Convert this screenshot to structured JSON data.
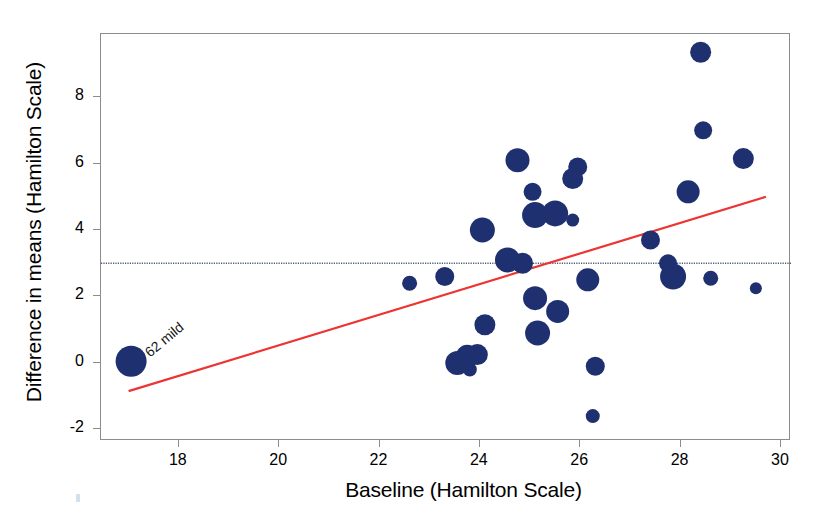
{
  "chart_data": {
    "type": "scatter",
    "title": "",
    "xlabel": "Baseline (Hamilton Scale)",
    "ylabel": "Difference in means (Hamilton Scale)",
    "xlim": [
      16.45,
      30.2
    ],
    "ylim": [
      -2.35,
      9.9
    ],
    "xticks": [
      18,
      20,
      22,
      24,
      26,
      28,
      30
    ],
    "xticklabels": [
      "18",
      "20",
      "22",
      "24",
      "26",
      "28",
      "30"
    ],
    "yticks": [
      8,
      6,
      4,
      2,
      0,
      -2
    ],
    "yticklabels": [
      "8",
      "6",
      "4",
      "2",
      "0",
      "-2"
    ],
    "grid": false,
    "legend": null,
    "marker_color": "#1f3070",
    "bubble_note": "marker area proportional to study weight",
    "points": [
      {
        "x": 17.05,
        "y": 0.05,
        "size": 15.5,
        "label": "62 mild"
      },
      {
        "x": 22.6,
        "y": 2.4,
        "size": 7.5
      },
      {
        "x": 23.3,
        "y": 2.6,
        "size": 9.5
      },
      {
        "x": 23.55,
        "y": 0.0,
        "size": 12.0
      },
      {
        "x": 23.75,
        "y": 0.2,
        "size": 11.5
      },
      {
        "x": 23.8,
        "y": -0.2,
        "size": 7.0
      },
      {
        "x": 23.95,
        "y": 0.25,
        "size": 10.5
      },
      {
        "x": 24.05,
        "y": 4.0,
        "size": 12.5
      },
      {
        "x": 24.1,
        "y": 1.15,
        "size": 10.5
      },
      {
        "x": 24.55,
        "y": 3.1,
        "size": 12.5
      },
      {
        "x": 24.75,
        "y": 6.1,
        "size": 12.0
      },
      {
        "x": 24.85,
        "y": 3.0,
        "size": 10.5
      },
      {
        "x": 25.05,
        "y": 5.15,
        "size": 9.0
      },
      {
        "x": 25.1,
        "y": 4.45,
        "size": 13.0
      },
      {
        "x": 25.1,
        "y": 1.95,
        "size": 12.0
      },
      {
        "x": 25.15,
        "y": 0.9,
        "size": 12.5
      },
      {
        "x": 25.5,
        "y": 4.5,
        "size": 13.0
      },
      {
        "x": 25.55,
        "y": 1.55,
        "size": 11.5
      },
      {
        "x": 25.95,
        "y": 5.9,
        "size": 9.5
      },
      {
        "x": 25.85,
        "y": 5.55,
        "size": 10.5
      },
      {
        "x": 25.85,
        "y": 4.3,
        "size": 6.5
      },
      {
        "x": 26.15,
        "y": 2.5,
        "size": 11.5
      },
      {
        "x": 26.3,
        "y": -0.1,
        "size": 9.5
      },
      {
        "x": 26.25,
        "y": -1.6,
        "size": 7.0
      },
      {
        "x": 27.4,
        "y": 3.7,
        "size": 9.5
      },
      {
        "x": 27.75,
        "y": 3.0,
        "size": 9.0
      },
      {
        "x": 27.85,
        "y": 2.6,
        "size": 13.0
      },
      {
        "x": 28.15,
        "y": 5.15,
        "size": 11.5
      },
      {
        "x": 28.4,
        "y": 9.35,
        "size": 10.5
      },
      {
        "x": 28.45,
        "y": 7.0,
        "size": 9.0
      },
      {
        "x": 28.6,
        "y": 2.55,
        "size": 7.5
      },
      {
        "x": 29.25,
        "y": 6.15,
        "size": 10.5
      },
      {
        "x": 29.5,
        "y": 2.25,
        "size": 6.0
      }
    ],
    "regression_line": {
      "color": "#ee3333",
      "style": "solid",
      "x_start": 17.0,
      "y_start": -0.85,
      "x_end": 29.7,
      "y_end": 5.0
    },
    "reference_line": {
      "color": "#4d5a78",
      "style": "dotted",
      "y": 3.0
    }
  },
  "annotations": [
    {
      "text": "62 mild",
      "rotation": -40
    }
  ],
  "axes": {
    "x_title": "Baseline (Hamilton Scale)",
    "y_title": "Difference in means (Hamilton Scale)"
  }
}
